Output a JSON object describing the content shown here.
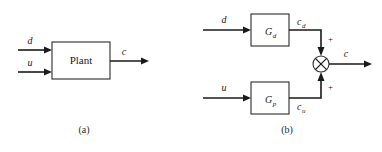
{
  "figure": {
    "type": "block-diagram",
    "background_color": "#ffffff",
    "line_color": "#1a1a1a",
    "box_fill": "#ffffff",
    "panels": [
      {
        "id": "panel-a",
        "caption": "(a)",
        "blocks": [
          {
            "id": "plant",
            "label": "Plant"
          }
        ],
        "signals": [
          {
            "id": "d-in",
            "label": "d",
            "role": "input"
          },
          {
            "id": "u-in",
            "label": "u",
            "role": "input"
          },
          {
            "id": "c-out",
            "label": "c",
            "role": "output"
          }
        ]
      },
      {
        "id": "panel-b",
        "caption": "(b)",
        "blocks": [
          {
            "id": "gd",
            "label": "G",
            "subscript": "d"
          },
          {
            "id": "gp",
            "label": "G",
            "subscript": "p"
          }
        ],
        "signals": [
          {
            "id": "d-in-b",
            "label": "d",
            "role": "input"
          },
          {
            "id": "u-in-b",
            "label": "u",
            "role": "input"
          },
          {
            "id": "cd",
            "label": "c",
            "subscript": "d",
            "role": "intermediate"
          },
          {
            "id": "cu",
            "label": "c",
            "subscript": "u",
            "role": "intermediate"
          },
          {
            "id": "c-out-b",
            "label": "c",
            "role": "output"
          }
        ],
        "summing_junction": {
          "id": "sum-node",
          "glyph": "circle-x",
          "sign_top": "+",
          "sign_bottom": "+"
        }
      }
    ]
  }
}
